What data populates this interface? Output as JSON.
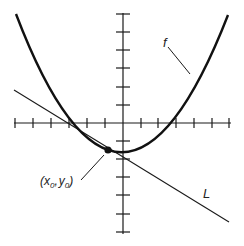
{
  "figure": {
    "type": "function-with-tangent-line",
    "curve_label": "f",
    "line_label": "L",
    "point_label_x": "x",
    "point_label_x_sub": "0",
    "point_label_y": "y",
    "point_label_y_sub": "0",
    "point_label_open": "(",
    "point_label_comma": ",",
    "point_label_close": ")",
    "x_axis_ticks": 12,
    "y_axis_ticks": 12,
    "colors": {
      "ink": "#1a1a1a",
      "background": "#ffffff"
    }
  }
}
